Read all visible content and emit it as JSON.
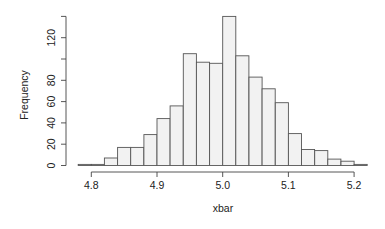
{
  "chart_data": {
    "type": "bar",
    "subtype": "histogram",
    "title": "",
    "xlabel": "xbar",
    "ylabel": "Frequency",
    "bin_width": 0.02,
    "bin_edges": [
      4.78,
      4.8,
      4.82,
      4.84,
      4.86,
      4.88,
      4.9,
      4.92,
      4.94,
      4.96,
      4.98,
      5.0,
      5.02,
      5.04,
      5.06,
      5.08,
      5.1,
      5.12,
      5.14,
      5.16,
      5.18,
      5.2,
      5.22
    ],
    "values": [
      1,
      1,
      7,
      17,
      17,
      29,
      44,
      56,
      105,
      97,
      96,
      140,
      103,
      83,
      72,
      59,
      30,
      15,
      14,
      6,
      4,
      1
    ],
    "x_ticks": [
      4.8,
      4.9,
      5.0,
      5.1,
      5.2
    ],
    "x_tick_labels": [
      "4.8",
      "4.9",
      "5.0",
      "5.1",
      "5.2"
    ],
    "y_ticks": [
      0,
      20,
      40,
      60,
      80,
      100,
      120,
      140
    ],
    "y_tick_labels": [
      "0",
      "20",
      "40",
      "60",
      "80",
      "",
      "120",
      ""
    ],
    "xlim": [
      4.78,
      5.22
    ],
    "ylim": [
      0,
      140
    ],
    "grid": false,
    "legend": null,
    "bar_fill": "#f2f2f2",
    "bar_stroke": "#555555"
  }
}
